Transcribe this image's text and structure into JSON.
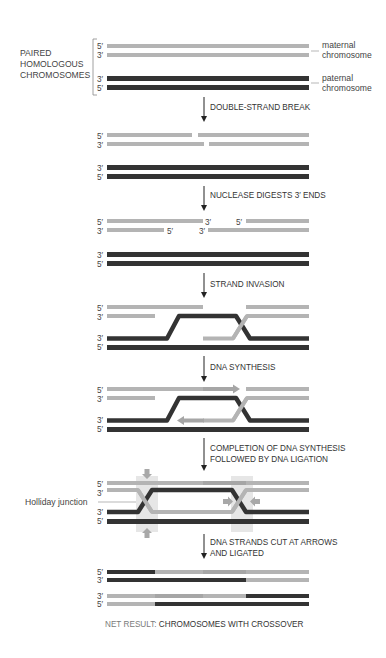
{
  "colors": {
    "maternal": "#b4b4b4",
    "maternal_new": "#a6a6a6",
    "paternal": "#333333",
    "label": "#333333",
    "muted_label": "#7a7a7a",
    "highlight_box": "#e6e6e6",
    "cut_arrow": "#a8a8a8"
  },
  "left_labels": {
    "paired_line1": "PAIRED",
    "paired_line2": "HOMOLOGOUS",
    "paired_line3": "CHROMOSOMES",
    "holliday": "Holliday junction"
  },
  "right_labels": {
    "maternal_line1": "maternal",
    "maternal_line2": "chromosome",
    "paternal_line1": "paternal",
    "paternal_line2": "chromosome"
  },
  "primes": {
    "five": "5′",
    "three": "3′"
  },
  "steps": [
    {
      "line1": "DOUBLE-STRAND BREAK",
      "line2": ""
    },
    {
      "line1": "NUCLEASE DIGESTS 3′ ENDS",
      "line2": ""
    },
    {
      "line1": "STRAND INVASION",
      "line2": ""
    },
    {
      "line1": "DNA SYNTHESIS",
      "line2": ""
    },
    {
      "line1": "COMPLETION OF DNA SYNTHESIS",
      "line2": "FOLLOWED BY DNA LIGATION"
    },
    {
      "line1": "DNA STRANDS CUT AT ARROWS",
      "line2": "AND LIGATED"
    }
  ],
  "net_result": {
    "prefix": "NET RESULT: ",
    "text": "CHROMOSOMES WITH CROSSOVER"
  }
}
